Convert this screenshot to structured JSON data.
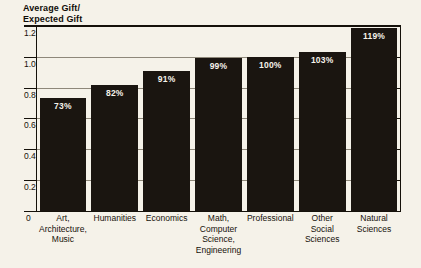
{
  "chart_data": {
    "type": "bar",
    "title": "",
    "ylabel": "Average Gift/\nExpected Gift",
    "xlabel": "",
    "ylim": [
      0,
      1.2
    ],
    "grid": true,
    "legend": "none",
    "yticks": [
      "0",
      "0.2",
      "0.4",
      "0.6",
      "0.8",
      "1.0",
      "1.2"
    ],
    "ytick_values": [
      0,
      0.2,
      0.4,
      0.6,
      0.8,
      1.0,
      1.2
    ],
    "categories": [
      "Art,\nArchitecture,\nMusic",
      "Humanities",
      "Economics",
      "Math,\nComputer\nScience,\nEngineering",
      "Professional",
      "Other\nSocial\nSciences",
      "Natural\nSciences"
    ],
    "values": [
      0.73,
      0.82,
      0.91,
      0.99,
      1.0,
      1.03,
      1.19
    ],
    "data_labels": [
      "73%",
      "82%",
      "91%",
      "99%",
      "100%",
      "103%",
      "119%"
    ],
    "bar_color": "#1a1510",
    "background_color": "#f5f2e9",
    "grid_color": "#8e887a",
    "axis_color": "#15110a",
    "label_color": "#f6f3ea"
  }
}
